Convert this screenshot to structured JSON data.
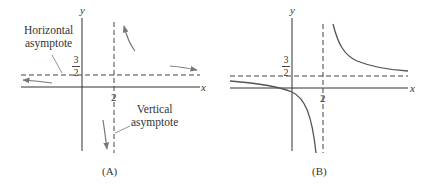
{
  "figures": [
    {
      "id": "A",
      "caption": "(A)",
      "axis_labels": {
        "x": "x",
        "y": "y"
      },
      "horizontal_asymptote": {
        "value_num": "3",
        "value_den": "2",
        "label": "Horizontal asymptote",
        "label_lines": [
          "Horizontal",
          "asymptote"
        ]
      },
      "vertical_asymptote": {
        "value": "2",
        "label": "Vertical asymptote",
        "label_lines": [
          "Vertical",
          "asymptote"
        ]
      },
      "arrows": [
        "upper-left of VA going up",
        "lower-left of VA going down",
        "far right approaching HA",
        "far left approaching HA"
      ]
    },
    {
      "id": "B",
      "caption": "(B)",
      "axis_labels": {
        "x": "x",
        "y": "y"
      },
      "horizontal_asymptote": {
        "value_num": "3",
        "value_den": "2"
      },
      "vertical_asymptote": {
        "value": "2"
      },
      "curve": "hyperbola branches, upper-right and lower-left of asymptotes"
    }
  ],
  "colors": {
    "axis": "#333333",
    "curve": "#555555",
    "dashed": "#444444",
    "arrow": "#777777"
  }
}
